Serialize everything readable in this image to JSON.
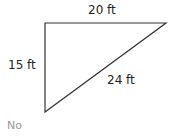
{
  "diagram": {
    "type": "right-triangle",
    "vertices": {
      "top_left": [
        45,
        23
      ],
      "top_right": [
        166,
        23
      ],
      "bottom_left": [
        45,
        112
      ]
    },
    "labels": {
      "top": "20 ft",
      "left": "15 ft",
      "hypotenuse": "24 ft"
    },
    "line_color": "#333333"
  },
  "answer": "No"
}
